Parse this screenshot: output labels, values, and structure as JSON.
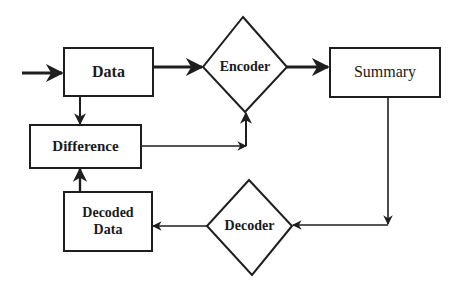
{
  "diagram": {
    "title": "",
    "colors": {
      "stroke": "#1e1e1e",
      "background": "#ffffff",
      "text": "#1a1a1a"
    },
    "nodes": {
      "data": {
        "label": "Data",
        "shape": "rectangle"
      },
      "encoder": {
        "label": "Encoder",
        "shape": "diamond"
      },
      "summary": {
        "label": "Summary",
        "shape": "rectangle"
      },
      "difference": {
        "label": "Difference",
        "shape": "rectangle"
      },
      "decoded_data": {
        "label_line1": "Decoded",
        "label_line2": "Data",
        "shape": "rectangle"
      },
      "decoder": {
        "label": "Decoder",
        "shape": "diamond"
      }
    },
    "edges": [
      {
        "from": "input",
        "to": "Data"
      },
      {
        "from": "Data",
        "to": "Encoder"
      },
      {
        "from": "Encoder",
        "to": "Summary"
      },
      {
        "from": "Data",
        "to": "Difference"
      },
      {
        "from": "Difference",
        "to": "Encoder"
      },
      {
        "from": "Summary",
        "to": "Decoder"
      },
      {
        "from": "Decoder",
        "to": "Decoded Data"
      },
      {
        "from": "Decoded Data",
        "to": "Difference"
      }
    ]
  }
}
